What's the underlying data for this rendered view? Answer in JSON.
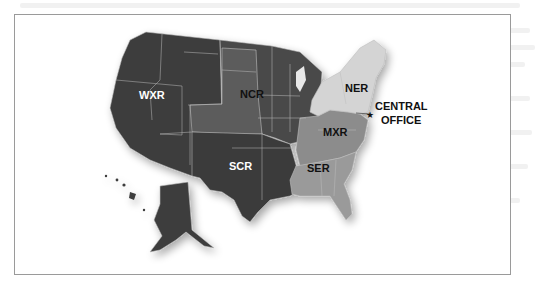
{
  "map": {
    "title": "",
    "regions": [
      {
        "code": "WXR",
        "label": "WXR",
        "label_color": "#ffffff",
        "fill": "#3d3d3d"
      },
      {
        "code": "NCR",
        "label": "NCR",
        "label_color": "#111111",
        "fill": "#4a4a4a",
        "plains_fill": "#5c5c5c"
      },
      {
        "code": "SCR",
        "label": "SCR",
        "label_color": "#ffffff",
        "fill": "#3a3a3a"
      },
      {
        "code": "MXR",
        "label": "MXR",
        "label_color": "#111111",
        "fill": "#8c8c8c"
      },
      {
        "code": "SER",
        "label": "SER",
        "label_color": "#111111",
        "fill": "#9a9a9a"
      },
      {
        "code": "NER",
        "label": "NER",
        "label_color": "#111111",
        "fill": "#d4d4d4"
      }
    ],
    "central_office": {
      "line1": "CENTRAL",
      "line2": "OFFICE",
      "marker": "star-icon"
    },
    "colors": {
      "frame_border": "#9a9a9a",
      "state_border": "#bdbdbd",
      "background": "#ffffff"
    }
  }
}
